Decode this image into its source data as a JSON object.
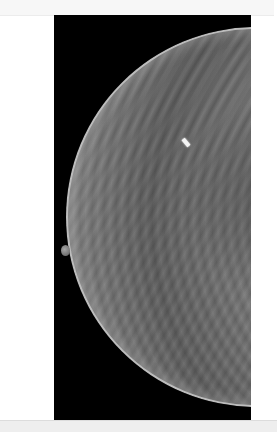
{
  "image": {
    "subject": "mammogram",
    "view": "craniocaudal-like, breast facing left",
    "background_color": "#000000",
    "frame_color": "#ffffff"
  },
  "annotations": {
    "marker": "bright clip/marker in upper-central tissue"
  },
  "bottom_strip": {
    "text": ""
  }
}
